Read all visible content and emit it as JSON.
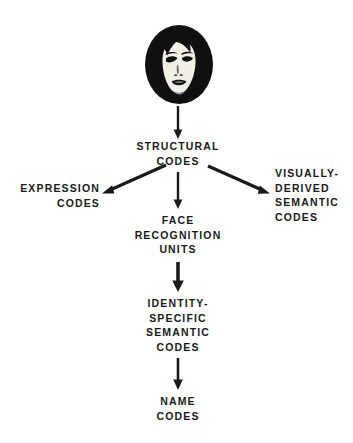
{
  "diagram": {
    "background_color": "#ffffff",
    "ink_color": "#1a1a1a",
    "stimulus": {
      "icon": "face-photograph-icon",
      "description": "High-contrast black and white photograph of a woman's face with dark bobbed hair"
    },
    "nodes": [
      {
        "id": "structural-codes",
        "label": "STRUCTURAL\nCODES",
        "align": "center"
      },
      {
        "id": "expression-codes",
        "label": "EXPRESSION\nCODES",
        "align": "right"
      },
      {
        "id": "visually-derived-semantic-codes",
        "label": "VISUALLY-\nDERIVED\nSEMANTIC\nCODES",
        "align": "left"
      },
      {
        "id": "face-recognition-units",
        "label": "FACE\nRECOGNITION\nUNITS",
        "align": "center"
      },
      {
        "id": "identity-specific-semantic-codes",
        "label": "IDENTITY-\nSPECIFIC\nSEMANTIC\nCODES",
        "align": "center"
      },
      {
        "id": "name-codes",
        "label": "NAME\nCODES",
        "align": "center"
      }
    ],
    "edges": [
      {
        "id": "face-to-structural",
        "from": "face-stimulus",
        "to": "structural-codes",
        "direction": "down"
      },
      {
        "id": "structural-to-expression",
        "from": "structural-codes",
        "to": "expression-codes",
        "direction": "down-left"
      },
      {
        "id": "structural-to-visually-derived",
        "from": "structural-codes",
        "to": "visually-derived-semantic-codes",
        "direction": "down-right"
      },
      {
        "id": "structural-to-face-recognition",
        "from": "structural-codes",
        "to": "face-recognition-units",
        "direction": "down"
      },
      {
        "id": "face-recognition-to-identity-specific",
        "from": "face-recognition-units",
        "to": "identity-specific-semantic-codes",
        "direction": "down"
      },
      {
        "id": "identity-specific-to-name",
        "from": "identity-specific-semantic-codes",
        "to": "name-codes",
        "direction": "down"
      }
    ]
  }
}
